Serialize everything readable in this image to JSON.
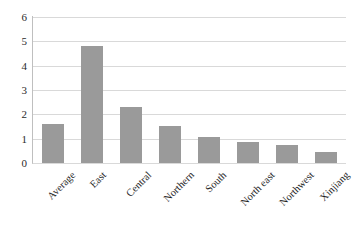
{
  "chart_data": {
    "type": "bar",
    "title": "",
    "xlabel": "",
    "ylabel": "",
    "categories": [
      "Average",
      "East",
      "Central",
      "Northern",
      "South",
      "North east",
      "Northwest",
      "Xinjiang"
    ],
    "values": [
      1.6,
      4.8,
      2.3,
      1.52,
      1.07,
      0.85,
      0.75,
      0.45
    ],
    "series": [
      {
        "name": "Series 1",
        "values": [
          1.6,
          4.8,
          2.3,
          1.52,
          1.07,
          0.85,
          0.75,
          0.45
        ]
      }
    ],
    "ylim": [
      0,
      6
    ],
    "yticks": [
      0,
      1,
      2,
      3,
      4,
      5,
      6
    ],
    "ytick_labels": [
      "0",
      "1",
      "2",
      "3",
      "4",
      "5",
      "6"
    ],
    "grid": "horizontal",
    "legend": "none",
    "bar_color": "#9a9a9a",
    "gridline_color": "#d9d9d9",
    "axis_color": "#bfbfbf",
    "background": "#ffffff",
    "xtick_rotation": -45
  }
}
